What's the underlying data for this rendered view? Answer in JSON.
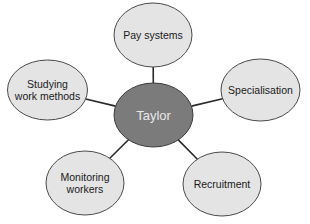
{
  "diagram": {
    "type": "mind-map",
    "center": {
      "label": "Taylor",
      "cx": 153.5,
      "cy": 115,
      "rx": 39.5,
      "ry": 32,
      "fill": "#7b7b7b",
      "stroke": "#3a3a3a",
      "text_color": "#e8e8e8"
    },
    "nodes": [
      {
        "id": "pay-systems",
        "lines": [
          "Pay systems"
        ],
        "cx": 153,
        "cy": 35,
        "rx": 39,
        "ry": 32
      },
      {
        "id": "specialisation",
        "lines": [
          "Specialisation"
        ],
        "cx": 260.5,
        "cy": 90,
        "rx": 39.5,
        "ry": 31
      },
      {
        "id": "recruitment",
        "lines": [
          "Recruitment"
        ],
        "cx": 222,
        "cy": 184,
        "rx": 39,
        "ry": 32
      },
      {
        "id": "monitoring-workers",
        "lines": [
          "Monitoring",
          "workers"
        ],
        "cx": 85,
        "cy": 183,
        "rx": 39,
        "ry": 32
      },
      {
        "id": "studying-work-methods",
        "lines": [
          "Studying",
          "work methods"
        ],
        "cx": 47.5,
        "cy": 90,
        "rx": 40,
        "ry": 30
      }
    ],
    "node_style": {
      "fill": "#e4e4e4",
      "stroke": "#4a4a4a",
      "text_color": "#1a1a1a"
    },
    "connector_color": "#2a2a2a"
  }
}
